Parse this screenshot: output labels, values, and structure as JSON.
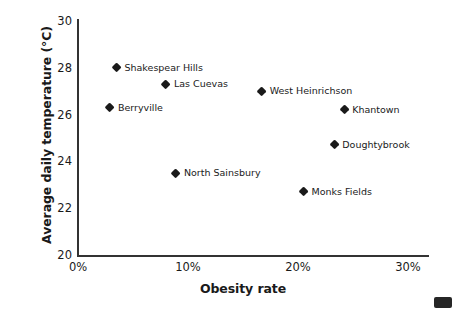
{
  "chart_data": {
    "type": "scatter",
    "title": "",
    "xlabel": "Obesity rate",
    "ylabel": "Average daily temperature (°C)",
    "xlim": [
      0,
      30
    ],
    "ylim": [
      20,
      30
    ],
    "xticks": [
      "0%",
      "10%",
      "20%",
      "30%"
    ],
    "xtick_values": [
      0,
      10,
      20,
      30
    ],
    "yticks": [
      "20",
      "22",
      "24",
      "26",
      "28",
      "30"
    ],
    "ytick_values": [
      20,
      22,
      24,
      26,
      28,
      30
    ],
    "grid": false,
    "legend": "none",
    "marker": "diamond",
    "marker_color": "#1a1a1a",
    "points": [
      {
        "label": "Shakespear Hills",
        "x": 3.5,
        "y": 28.0
      },
      {
        "label": "Las Cuevas",
        "x": 8.0,
        "y": 27.3
      },
      {
        "label": "West Heinrichson",
        "x": 16.7,
        "y": 27.0
      },
      {
        "label": "Berryville",
        "x": 2.9,
        "y": 26.3
      },
      {
        "label": "Khantown",
        "x": 24.2,
        "y": 26.2
      },
      {
        "label": "Doughtybrook",
        "x": 23.3,
        "y": 24.7
      },
      {
        "label": "North Sainsbury",
        "x": 8.9,
        "y": 23.5
      },
      {
        "label": "Monks Fields",
        "x": 20.5,
        "y": 22.7
      }
    ]
  }
}
